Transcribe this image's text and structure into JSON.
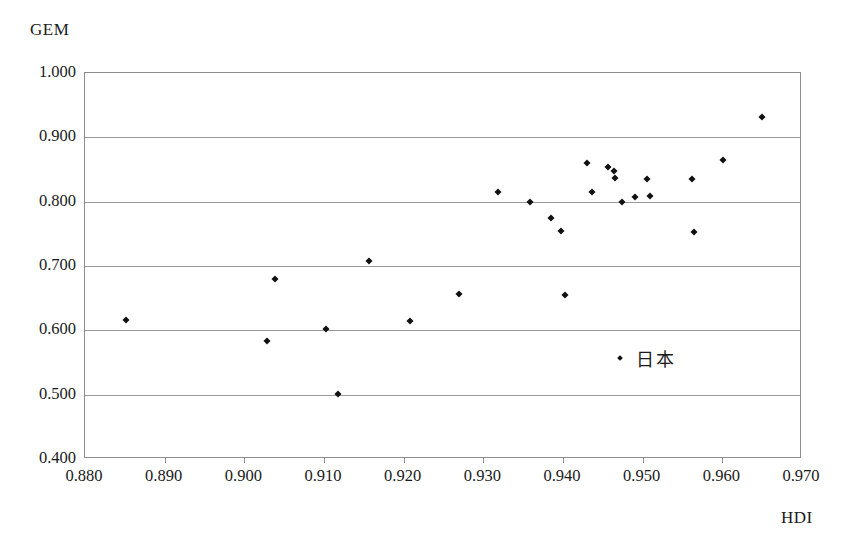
{
  "chart_data": {
    "type": "scatter",
    "title": "",
    "xlabel": "HDI",
    "ylabel": "GEM",
    "xlim": [
      0.88,
      0.97
    ],
    "ylim": [
      0.4,
      1.0
    ],
    "xticks": [
      "0.880",
      "0.890",
      "0.900",
      "0.910",
      "0.920",
      "0.930",
      "0.940",
      "0.950",
      "0.960",
      "0.970"
    ],
    "yticks": [
      "0.400",
      "0.500",
      "0.600",
      "0.700",
      "0.800",
      "0.900",
      "1.000"
    ],
    "grid": "horizontal",
    "legend_position": "inside-right",
    "series": [
      {
        "name": "日本",
        "marker": "diamond",
        "color": "#111111",
        "points": [
          {
            "x": 0.8851,
            "y": 0.6154
          },
          {
            "x": 0.9029,
            "y": 0.5829
          },
          {
            "x": 0.9038,
            "y": 0.6805
          },
          {
            "x": 0.9102,
            "y": 0.6024
          },
          {
            "x": 0.9118,
            "y": 0.5004
          },
          {
            "x": 0.9157,
            "y": 0.7078
          },
          {
            "x": 0.9208,
            "y": 0.6139
          },
          {
            "x": 0.927,
            "y": 0.656
          },
          {
            "x": 0.9319,
            "y": 0.8158
          },
          {
            "x": 0.9359,
            "y": 0.7992
          },
          {
            "x": 0.9385,
            "y": 0.7749
          },
          {
            "x": 0.9397,
            "y": 0.7551
          },
          {
            "x": 0.9402,
            "y": 0.6545
          },
          {
            "x": 0.943,
            "y": 0.8601
          },
          {
            "x": 0.9436,
            "y": 0.8158
          },
          {
            "x": 0.9456,
            "y": 0.854
          },
          {
            "x": 0.9464,
            "y": 0.8483
          },
          {
            "x": 0.9465,
            "y": 0.8375
          },
          {
            "x": 0.9474,
            "y": 0.7997
          },
          {
            "x": 0.949,
            "y": 0.807
          },
          {
            "x": 0.9506,
            "y": 0.835
          },
          {
            "x": 0.9509,
            "y": 0.8085
          },
          {
            "x": 0.9562,
            "y": 0.8345
          },
          {
            "x": 0.9565,
            "y": 0.753
          },
          {
            "x": 0.9601,
            "y": 0.8655
          },
          {
            "x": 0.965,
            "y": 0.932
          }
        ]
      }
    ]
  },
  "legend": {
    "label": "日本",
    "marker_name": "diamond-marker"
  },
  "axes": {
    "y_title": "GEM",
    "x_title": "HDI"
  }
}
